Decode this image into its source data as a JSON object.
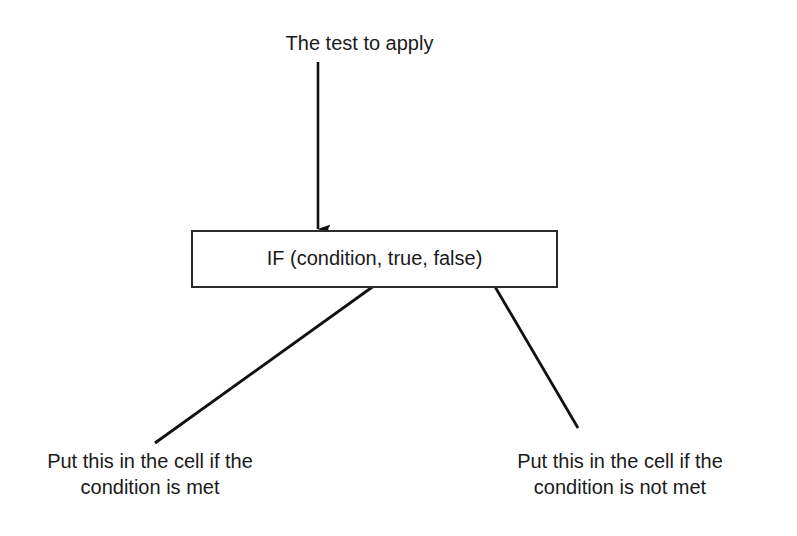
{
  "diagram": {
    "title_note": "The test to apply",
    "formula": {
      "text": "IF (condition, true, false)"
    },
    "captions": {
      "left": {
        "line1": "Put this in the cell if the",
        "line2": "condition is met"
      },
      "right": {
        "line1": "Put this in the cell if the",
        "line2": "condition is not met"
      }
    },
    "colors": {
      "ink": "#1a1a1a",
      "stroke": "#2b2b2b",
      "background": "#ffffff"
    },
    "arrows": {
      "top_to_box": {
        "name": "arrow-test-to-formula",
        "from_x": 318,
        "from_y": 62,
        "to_x": 318,
        "to_y": 229
      },
      "left_to_true": {
        "name": "arrow-met-to-true",
        "from_x": 155,
        "from_y": 443,
        "to_x": 396,
        "to_y": 270
      },
      "right_to_false": {
        "name": "arrow-notmet-to-false",
        "from_x": 578,
        "from_y": 428,
        "to_x": 484,
        "to_y": 268
      }
    }
  }
}
